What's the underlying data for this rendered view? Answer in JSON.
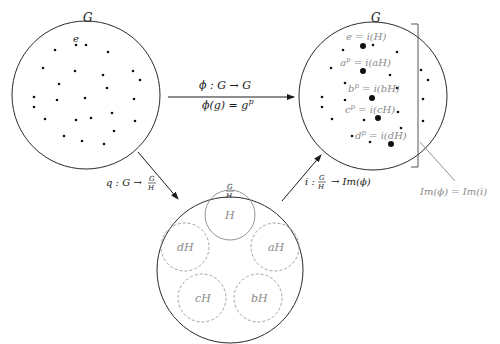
{
  "left_group": {
    "label": "G",
    "identity_label": "e",
    "dots": [
      [
        76,
        45
      ],
      [
        86,
        45
      ],
      [
        55,
        50
      ],
      [
        108,
        52
      ],
      [
        43,
        68
      ],
      [
        75,
        71
      ],
      [
        103,
        75
      ],
      [
        133,
        71
      ],
      [
        59,
        84
      ],
      [
        140,
        80
      ],
      [
        107,
        88
      ],
      [
        34,
        97
      ],
      [
        57,
        100
      ],
      [
        85,
        98
      ],
      [
        134,
        99
      ],
      [
        34,
        107
      ],
      [
        112,
        113
      ],
      [
        45,
        119
      ],
      [
        76,
        120
      ],
      [
        91,
        118
      ],
      [
        135,
        121
      ],
      [
        114,
        131
      ],
      [
        64,
        136
      ],
      [
        82,
        141
      ],
      [
        104,
        144
      ]
    ]
  },
  "right_group": {
    "label": "G",
    "image_labels": [
      "e = i(H)",
      "a^p = i(aH)",
      "b^p = i(bH)",
      "c^p = i(cH)",
      "d^p = i(dH)"
    ],
    "big_dots": [
      [
        363,
        46
      ],
      [
        363,
        71
      ],
      [
        372,
        98
      ],
      [
        378,
        118
      ],
      [
        391,
        144
      ]
    ],
    "small_dots": [
      [
        373,
        45
      ],
      [
        343,
        50
      ],
      [
        397,
        52
      ],
      [
        331,
        68
      ],
      [
        390,
        75
      ],
      [
        345,
        83
      ],
      [
        397,
        88
      ],
      [
        322,
        97
      ],
      [
        345,
        100
      ],
      [
        322,
        107
      ],
      [
        398,
        112
      ],
      [
        364,
        120
      ],
      [
        332,
        119
      ],
      [
        401,
        128
      ],
      [
        352,
        136
      ],
      [
        370,
        142
      ]
    ],
    "outside_dots": [
      [
        421,
        70
      ],
      [
        428,
        80
      ],
      [
        423,
        99
      ],
      [
        423,
        121
      ]
    ],
    "bracket_label": "Im(ϕ) = Im(i)"
  },
  "quotient_group": {
    "label_num": "G",
    "label_den": "H",
    "cosets": [
      {
        "label": "H",
        "style": "solid"
      },
      {
        "label": "aH",
        "style": "dashed"
      },
      {
        "label": "bH",
        "style": "dashed"
      },
      {
        "label": "cH",
        "style": "dashed"
      },
      {
        "label": "dH",
        "style": "dashed"
      }
    ]
  },
  "arrows": {
    "phi": {
      "line1": "ϕ : G → G",
      "line2_prefix": "ϕ(g) = g",
      "line2_sup": "p"
    },
    "q": {
      "prefix": "q : G →",
      "num": "G",
      "den": "H"
    },
    "i": {
      "prefix": "i :",
      "num": "G",
      "den": "H",
      "suffix": "→ Im(ϕ)"
    }
  }
}
